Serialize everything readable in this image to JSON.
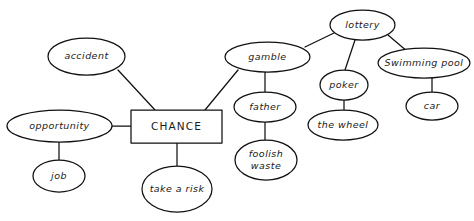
{
  "diagram": {
    "type": "mind-map",
    "background_color": "#ffffff",
    "stroke_color": "#111111",
    "text_color": "#1a1a1a",
    "canvas": {
      "width": 474,
      "height": 221
    },
    "root": {
      "id": "chance",
      "label": "CHANCE",
      "shape": "rectangle",
      "x": 176.5,
      "y": 126.5,
      "w": 91,
      "h": 33
    },
    "nodes": [
      {
        "id": "accident",
        "label": "accident",
        "shape": "ellipse",
        "x": 86.5,
        "y": 56.5,
        "rx": 38.5,
        "ry": 18.5,
        "lines": [
          "accident"
        ]
      },
      {
        "id": "opportunity",
        "label": "opportunity",
        "shape": "ellipse",
        "x": 59.5,
        "y": 126,
        "rx": 52.5,
        "ry": 16,
        "lines": [
          "opportunity"
        ]
      },
      {
        "id": "job",
        "label": "job",
        "shape": "ellipse",
        "x": 59,
        "y": 176,
        "rx": 26,
        "ry": 16,
        "lines": [
          "job"
        ]
      },
      {
        "id": "take-a-risk",
        "label": "take a risk",
        "shape": "ellipse",
        "x": 177,
        "y": 189,
        "rx": 35,
        "ry": 23,
        "lines": [
          "take a risk"
        ]
      },
      {
        "id": "gamble",
        "label": "gamble",
        "shape": "ellipse",
        "x": 267.5,
        "y": 57,
        "rx": 42.5,
        "ry": 15,
        "lines": [
          "gamble"
        ]
      },
      {
        "id": "father",
        "label": "father",
        "shape": "ellipse",
        "x": 265,
        "y": 107,
        "rx": 31,
        "ry": 15,
        "lines": [
          "father"
        ]
      },
      {
        "id": "foolish-waste",
        "label": "foolish waste",
        "shape": "ellipse",
        "x": 266,
        "y": 160,
        "rx": 31,
        "ry": 20,
        "lines": [
          "foolish",
          "waste"
        ]
      },
      {
        "id": "lottery",
        "label": "lottery",
        "shape": "ellipse",
        "x": 362.5,
        "y": 25,
        "rx": 32.5,
        "ry": 15,
        "lines": [
          "lottery"
        ]
      },
      {
        "id": "poker",
        "label": "poker",
        "shape": "ellipse",
        "x": 344,
        "y": 85,
        "rx": 24,
        "ry": 15,
        "lines": [
          "poker"
        ]
      },
      {
        "id": "the-wheel",
        "label": "the wheel",
        "shape": "ellipse",
        "x": 343,
        "y": 125,
        "rx": 35,
        "ry": 15,
        "lines": [
          "the wheel"
        ]
      },
      {
        "id": "swimming-pool",
        "label": "Swimming pool",
        "shape": "ellipse",
        "x": 424,
        "y": 63,
        "rx": 46,
        "ry": 15,
        "lines": [
          "Swimming pool"
        ]
      },
      {
        "id": "car",
        "label": "car",
        "shape": "ellipse",
        "x": 432,
        "y": 106,
        "rx": 26,
        "ry": 14,
        "lines": [
          "car"
        ]
      }
    ],
    "edges": [
      {
        "id": "edge-accident-chance",
        "from": "accident",
        "to": "chance",
        "x1": 118,
        "y1": 70,
        "x2": 155,
        "y2": 110
      },
      {
        "id": "edge-opportunity-chance",
        "from": "opportunity",
        "to": "chance",
        "x1": 112,
        "y1": 126,
        "x2": 131,
        "y2": 126
      },
      {
        "id": "edge-opportunity-job",
        "from": "opportunity",
        "to": "job",
        "x1": 59,
        "y1": 142,
        "x2": 59,
        "y2": 160
      },
      {
        "id": "edge-chance-take-a-risk",
        "from": "chance",
        "to": "take-a-risk",
        "x1": 177,
        "y1": 143,
        "x2": 177,
        "y2": 166
      },
      {
        "id": "edge-gamble-chance",
        "from": "gamble",
        "to": "chance",
        "x1": 238,
        "y1": 70,
        "x2": 205,
        "y2": 110
      },
      {
        "id": "edge-gamble-father",
        "from": "gamble",
        "to": "father",
        "x1": 265,
        "y1": 72,
        "x2": 265,
        "y2": 92
      },
      {
        "id": "edge-father-foolish-waste",
        "from": "father",
        "to": "foolish-waste",
        "x1": 265,
        "y1": 122,
        "x2": 265,
        "y2": 140
      },
      {
        "id": "edge-gamble-lottery",
        "from": "gamble",
        "to": "lottery",
        "x1": 305,
        "y1": 47,
        "x2": 334,
        "y2": 33
      },
      {
        "id": "edge-lottery-poker",
        "from": "lottery",
        "to": "poker",
        "x1": 355,
        "y1": 40,
        "x2": 345,
        "y2": 70
      },
      {
        "id": "edge-poker-the-wheel",
        "from": "poker",
        "to": "the-wheel",
        "x1": 344,
        "y1": 100,
        "x2": 344,
        "y2": 110
      },
      {
        "id": "edge-lottery-swimming-pool",
        "from": "lottery",
        "to": "swimming-pool",
        "x1": 388,
        "y1": 35,
        "x2": 408,
        "y2": 52
      },
      {
        "id": "edge-swimming-pool-car",
        "from": "swimming-pool",
        "to": "car",
        "x1": 432,
        "y1": 78,
        "x2": 432,
        "y2": 92
      }
    ]
  }
}
